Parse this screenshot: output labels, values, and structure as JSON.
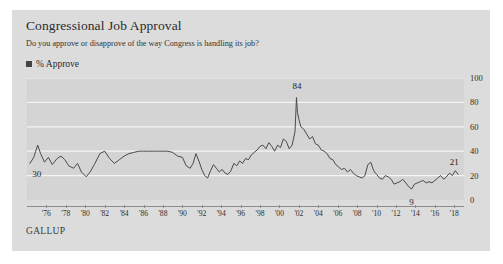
{
  "card": {
    "background_color": "#dcdcdc",
    "plot_background_color": "#d4d4d4"
  },
  "header": {
    "title": "Congressional Job Approval",
    "subtitle": "Do you approve or disapprove of the way Congress is handling its job?"
  },
  "legend": {
    "position": "top-left",
    "marker_icon": "legend-square-marker",
    "entries": [
      {
        "label": "% Approve",
        "color": "#444444"
      }
    ]
  },
  "source": {
    "label": "GALLUP"
  },
  "axes": {
    "y_ticks": [
      "0",
      "20",
      "40",
      "60",
      "80",
      "100"
    ],
    "x_ticks": [
      "'76",
      "'78",
      "'80",
      "'82",
      "'84",
      "'86",
      "'88",
      "'90",
      "'92",
      "'94",
      "'96",
      "'98",
      "'00",
      "'02",
      "'04",
      "'06",
      "'08",
      "'10",
      "'12",
      "'14",
      "'16",
      "'18"
    ]
  },
  "annotations": [
    {
      "name": "annotation-start-value",
      "text": "30",
      "x_year": 1975.2,
      "y_value": 30,
      "dx": -2,
      "dy": 12
    },
    {
      "name": "annotation-peak-value",
      "text": "84",
      "x_year": 2001.8,
      "y_value": 84,
      "dx": 0,
      "dy": -11
    },
    {
      "name": "annotation-low-value",
      "text": "9",
      "x_year": 2013.6,
      "y_value": 9,
      "dx": 0,
      "dy": 14
    },
    {
      "name": "annotation-end-value",
      "text": "21",
      "x_year": 2018.2,
      "y_value": 21,
      "dx": -2,
      "dy": -11
    }
  ],
  "chart_data": {
    "type": "line",
    "title": "Congressional Job Approval",
    "subtitle": "Do you approve or disapprove of the way Congress is handling its job?",
    "source": "GALLUP",
    "xlabel": "",
    "ylabel": "% Approve",
    "xlim": [
      1974,
      2019
    ],
    "ylim": [
      0,
      100
    ],
    "grid": "horizontal",
    "legend_position": "top-left",
    "line_color": "#4a4a4a",
    "series": [
      {
        "name": "% Approve",
        "x": [
          1974.3,
          1974.7,
          1975.1,
          1975.4,
          1975.8,
          1976.2,
          1976.6,
          1977.1,
          1977.5,
          1977.9,
          1978.3,
          1978.8,
          1979.2,
          1979.6,
          1980.1,
          1980.5,
          1981.0,
          1981.5,
          1982.0,
          1982.5,
          1983.0,
          1983.5,
          1984.0,
          1984.5,
          1985.0,
          1985.5,
          1986.0,
          1986.5,
          1987.0,
          1987.5,
          1988.0,
          1988.5,
          1989.0,
          1989.5,
          1990.0,
          1990.4,
          1990.8,
          1991.1,
          1991.4,
          1991.7,
          1992.0,
          1992.3,
          1992.6,
          1992.9,
          1993.2,
          1993.5,
          1993.8,
          1994.1,
          1994.4,
          1994.7,
          1995.0,
          1995.3,
          1995.6,
          1995.9,
          1996.2,
          1996.5,
          1996.8,
          1997.1,
          1997.4,
          1997.7,
          1998.0,
          1998.3,
          1998.6,
          1998.9,
          1999.2,
          1999.5,
          1999.8,
          2000.1,
          2000.4,
          2000.7,
          2001.0,
          2001.3,
          2001.6,
          2001.75,
          2001.85,
          2002.0,
          2002.2,
          2002.5,
          2002.8,
          2003.1,
          2003.4,
          2003.7,
          2004.0,
          2004.3,
          2004.6,
          2004.9,
          2005.2,
          2005.5,
          2005.8,
          2006.1,
          2006.4,
          2006.7,
          2007.0,
          2007.3,
          2007.6,
          2007.9,
          2008.2,
          2008.5,
          2008.8,
          2009.1,
          2009.4,
          2009.7,
          2010.0,
          2010.3,
          2010.6,
          2010.9,
          2011.2,
          2011.5,
          2011.8,
          2012.1,
          2012.4,
          2012.7,
          2013.0,
          2013.3,
          2013.6,
          2013.9,
          2014.2,
          2014.5,
          2014.8,
          2015.1,
          2015.4,
          2015.7,
          2016.0,
          2016.3,
          2016.6,
          2016.9,
          2017.2,
          2017.5,
          2017.8,
          2018.1,
          2018.4
        ],
        "y": [
          30,
          35,
          45,
          38,
          31,
          35,
          29,
          34,
          36,
          33,
          28,
          26,
          30,
          23,
          19,
          23,
          30,
          38,
          40,
          34,
          30,
          33,
          36,
          38,
          39,
          40,
          40,
          40,
          40,
          40,
          40,
          40,
          39,
          36,
          35,
          28,
          26,
          30,
          38,
          32,
          25,
          20,
          18,
          24,
          29,
          26,
          23,
          25,
          22,
          21,
          24,
          30,
          28,
          32,
          30,
          34,
          33,
          37,
          39,
          41,
          44,
          45,
          42,
          47,
          44,
          40,
          45,
          43,
          50,
          48,
          42,
          45,
          56,
          84,
          72,
          66,
          60,
          58,
          54,
          50,
          52,
          46,
          45,
          41,
          40,
          38,
          34,
          33,
          29,
          27,
          25,
          26,
          23,
          25,
          22,
          20,
          19,
          18,
          20,
          29,
          31,
          24,
          21,
          18,
          17,
          20,
          19,
          17,
          13,
          14,
          15,
          17,
          14,
          11,
          9,
          13,
          14,
          15,
          16,
          14,
          15,
          14,
          16,
          18,
          20,
          17,
          19,
          22,
          20,
          24,
          21
        ]
      }
    ]
  }
}
